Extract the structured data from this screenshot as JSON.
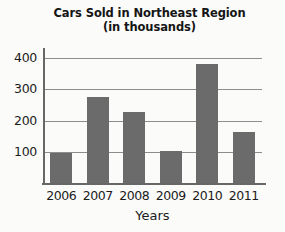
{
  "chart_data": {
    "type": "bar",
    "title": "Cars Sold in Northeast Region",
    "subtitle": "(in thousands)",
    "xlabel": "Years",
    "ylabel": "",
    "categories": [
      "2006",
      "2007",
      "2008",
      "2009",
      "2010",
      "2011"
    ],
    "values": [
      95,
      272,
      225,
      100,
      375,
      160
    ],
    "ylim": [
      0,
      430
    ],
    "yticks": [
      100,
      200,
      300,
      400
    ],
    "ytick_labels": [
      "100",
      "200",
      "300",
      "400"
    ],
    "grid": true,
    "legend": "none",
    "bar_color": "#6b6b6b",
    "axis_color": "#676767",
    "grid_color": "#8d8d8d",
    "background_color": "#fbfbfa"
  }
}
